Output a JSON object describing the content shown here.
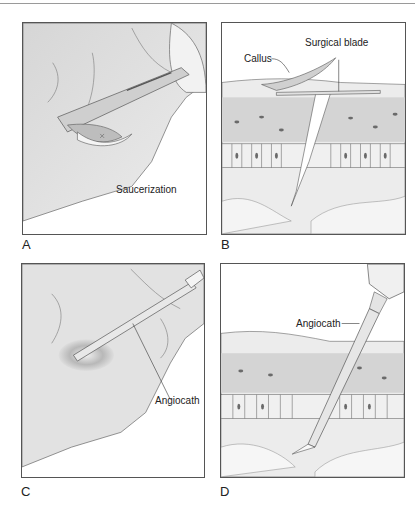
{
  "figure": {
    "panels": [
      {
        "id": "A",
        "label": "A",
        "callouts": [
          "Saucerization"
        ]
      },
      {
        "id": "B",
        "label": "B",
        "callouts": [
          "Callus",
          "Surgical blade"
        ]
      },
      {
        "id": "C",
        "label": "C",
        "callouts": [
          "Angiocath"
        ]
      },
      {
        "id": "D",
        "label": "D",
        "callouts": [
          "Angiocath"
        ]
      }
    ]
  },
  "colors": {
    "frame": "#555555",
    "skin": "#e4e4e4",
    "skin_shadow": "#c8c8c8",
    "epidermis": "#d2d2d2",
    "nucleus": "#6a6a6a"
  }
}
